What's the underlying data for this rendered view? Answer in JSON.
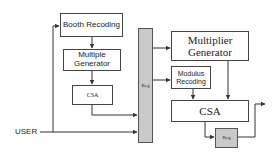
{
  "diagram": {
    "left_blocks": {
      "booth_recoding": "Booth Recoding",
      "multiple_generator": "Multiple Generator",
      "csa": "CSA"
    },
    "input_label": "USER",
    "register_column": "Reg",
    "right_blocks": {
      "multiplier_generator": "Multiplier Generator",
      "modulus_recoding": "Modulus Recoding",
      "csa": "CSA",
      "output_register": "Reg"
    },
    "colors": {
      "line": "#333333",
      "box_border": "#444444",
      "register_fill": "#c9c9c9"
    }
  }
}
